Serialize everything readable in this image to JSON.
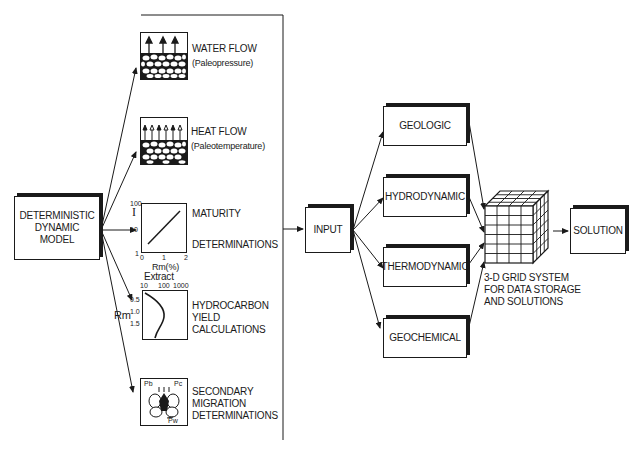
{
  "model_box": {
    "label_line1": "DETERMINISTIC",
    "label_line2": "DYNAMIC",
    "label_line3": "MODEL"
  },
  "components": [
    {
      "title": "WATER FLOW",
      "subtitle": "(Paleopressure)",
      "icon": "water-flow-icon"
    },
    {
      "title": "HEAT FLOW",
      "subtitle": "(Paleotemperature)",
      "icon": "heat-flow-icon"
    },
    {
      "title": "MATURITY",
      "subtitle": "DETERMINATIONS",
      "icon": "maturity-plot-icon"
    },
    {
      "title_line1": "HYDROCARBON",
      "title_line2": "YIELD",
      "title_line3": "CALCULATIONS",
      "icon": "hydrocarbon-yield-plot-icon"
    },
    {
      "title_line1": "SECONDARY",
      "title_line2": "MIGRATION",
      "title_line3": "DETERMINATIONS",
      "icon": "migration-pressure-icon"
    }
  ],
  "maturity_plot": {
    "y_axis_label": "I",
    "y_ticks": [
      "100",
      "10",
      "1"
    ],
    "x_ticks": [
      "0",
      "1",
      "2"
    ],
    "x_axis_label": "Rm(%)"
  },
  "yield_plot": {
    "top_label": "Extract",
    "x_ticks": [
      "10",
      "100",
      "1000"
    ],
    "y_ticks": [
      "0.5",
      "1.0",
      "1.5"
    ],
    "side_label": "Rm"
  },
  "migration_icon": {
    "labels": [
      "Pb",
      "Pc",
      "Pw"
    ]
  },
  "input_box": {
    "label": "INPUT"
  },
  "modules": [
    {
      "label": "GEOLOGIC"
    },
    {
      "label": "HYDRODYNAMIC"
    },
    {
      "label": "THERMODYNAMIC"
    },
    {
      "label": "GEOCHEMICAL"
    }
  ],
  "grid": {
    "caption_line1": "3-D GRID SYSTEM",
    "caption_line2": "FOR DATA STORAGE",
    "caption_line3": "AND SOLUTIONS"
  },
  "solution_box": {
    "label": "SOLUTION"
  }
}
